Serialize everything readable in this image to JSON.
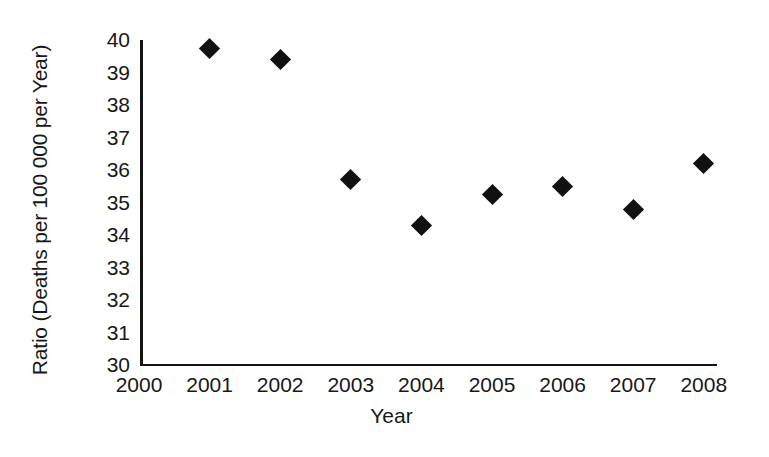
{
  "chart_data": {
    "type": "scatter",
    "title": "",
    "xlabel": "Year",
    "ylabel": "Ratio (Deaths per 100 000 per Year)",
    "xlim": [
      2000,
      2008.2
    ],
    "ylim": [
      30,
      40
    ],
    "grid": false,
    "legend": null,
    "marker": "filled-diamond",
    "marker_color": "#111111",
    "axis_color": "#141414",
    "x_ticks": [
      2000,
      2001,
      2002,
      2003,
      2004,
      2005,
      2006,
      2007,
      2008
    ],
    "x_tick_labels": [
      "2000",
      "2001",
      "2002",
      "2003",
      "2004",
      "2005",
      "2006",
      "2007",
      "2008"
    ],
    "y_ticks": [
      30,
      31,
      32,
      33,
      34,
      35,
      36,
      37,
      38,
      39,
      40
    ],
    "y_tick_labels": [
      "30",
      "31",
      "32",
      "33",
      "34",
      "35",
      "36",
      "37",
      "38",
      "39",
      "40"
    ],
    "x": [
      2001,
      2002,
      2003,
      2004,
      2005,
      2006,
      2007,
      2008
    ],
    "values": [
      39.75,
      39.4,
      35.7,
      34.3,
      35.25,
      35.5,
      34.8,
      36.2
    ],
    "points": [
      {
        "year": "2001",
        "value": 39.75
      },
      {
        "year": "2002",
        "value": 39.4
      },
      {
        "year": "2003",
        "value": 35.7
      },
      {
        "year": "2004",
        "value": 34.3
      },
      {
        "year": "2005",
        "value": 35.25
      },
      {
        "year": "2006",
        "value": 35.5
      },
      {
        "year": "2007",
        "value": 34.8
      },
      {
        "year": "2008",
        "value": 36.2
      }
    ]
  }
}
